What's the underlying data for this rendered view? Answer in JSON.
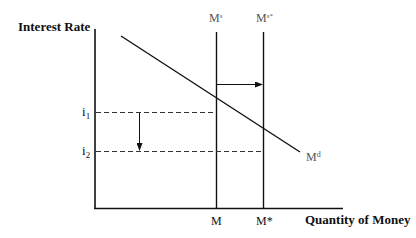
{
  "diagram": {
    "type": "money-market",
    "y_axis_label": "Interest Rate",
    "x_axis_label": "Quantity of Money",
    "supply_label": "M",
    "supply_sup": "s",
    "supply_new_label": "M",
    "supply_new_sup": "s*",
    "demand_label": "M",
    "demand_sup": "d",
    "i1_label": "i",
    "i1_sub": "1",
    "i2_label": "i",
    "i2_sub": "2",
    "m_label": "M",
    "m_star_label": "M*",
    "colors": {
      "line": "#111111",
      "label": "#555555",
      "dashed": "#333333"
    }
  }
}
